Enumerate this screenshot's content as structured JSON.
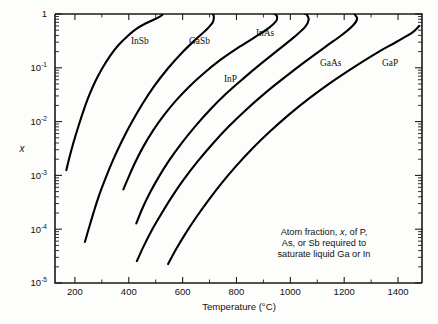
{
  "chart_data": {
    "type": "line",
    "title": "",
    "xlabel": "Temperature (°C)",
    "ylabel": "x",
    "yscale": "log",
    "xlim": [
      126,
      1489
    ],
    "ylim": [
      1e-05,
      1
    ],
    "grid": false,
    "legend": "inline-curve-labels",
    "x_ticks_major": [
      200,
      400,
      600,
      800,
      1000,
      1200,
      1400
    ],
    "x_tick_labels": [
      "200",
      "400",
      "600",
      "800",
      "1000",
      "1200",
      "1400"
    ],
    "x_ticks_minor": [
      300,
      500,
      700,
      900,
      1100,
      1300
    ],
    "y_ticks_major": [
      1,
      0.1,
      0.01,
      0.001,
      0.0001,
      1e-05
    ],
    "y_tick_labels": [
      "1",
      "10⁻¹",
      "10⁻²",
      "10⁻³",
      "10⁻⁴",
      "10⁻⁵"
    ],
    "annotation": {
      "lines": [
        "Atom fraction, x, of P,",
        "As, or Sb required to",
        "saturate liquid Ga or In"
      ],
      "italic_token": "x"
    },
    "series": [
      {
        "name": "InSb",
        "label": "InSb",
        "label_x": 131,
        "label_y": 44,
        "points": [
          [
            168,
            0.00125
          ],
          [
            180,
            0.0022
          ],
          [
            196,
            0.0043
          ],
          [
            213,
            0.0082
          ],
          [
            232,
            0.016
          ],
          [
            252,
            0.03
          ],
          [
            275,
            0.055
          ],
          [
            300,
            0.095
          ],
          [
            330,
            0.165
          ],
          [
            362,
            0.265
          ],
          [
            398,
            0.4
          ],
          [
            432,
            0.545
          ],
          [
            462,
            0.665
          ],
          [
            490,
            0.775
          ],
          [
            512,
            0.875
          ],
          [
            524,
            0.96
          ],
          [
            524,
            1.0
          ]
        ]
      },
      {
        "name": "GaSb",
        "label": "GaSb",
        "label_x": 189,
        "label_y": 44,
        "points": [
          [
            237,
            5.8e-05
          ],
          [
            252,
            0.000105
          ],
          [
            270,
            0.00021
          ],
          [
            290,
            0.00043
          ],
          [
            315,
            0.00092
          ],
          [
            343,
            0.002
          ],
          [
            375,
            0.0044
          ],
          [
            410,
            0.0095
          ],
          [
            450,
            0.021
          ],
          [
            495,
            0.046
          ],
          [
            545,
            0.097
          ],
          [
            595,
            0.185
          ],
          [
            645,
            0.325
          ],
          [
            690,
            0.52
          ],
          [
            712,
            0.7
          ],
          [
            716,
            0.88
          ],
          [
            712,
            1.0
          ]
        ]
      },
      {
        "name": "InAs",
        "label": "InAs",
        "label_x": 256,
        "label_y": 36,
        "points": [
          [
            380,
            0.00055
          ],
          [
            400,
            0.00095
          ],
          [
            425,
            0.0018
          ],
          [
            455,
            0.0035
          ],
          [
            490,
            0.0068
          ],
          [
            530,
            0.013
          ],
          [
            575,
            0.0245
          ],
          [
            625,
            0.045
          ],
          [
            680,
            0.08
          ],
          [
            740,
            0.14
          ],
          [
            805,
            0.235
          ],
          [
            870,
            0.375
          ],
          [
            922,
            0.56
          ],
          [
            948,
            0.75
          ],
          [
            950,
            0.92
          ],
          [
            942,
            1.0
          ]
        ]
      },
      {
        "name": "InP",
        "label": "InP",
        "label_x": 224,
        "label_y": 82,
        "points": [
          [
            428,
            0.000128
          ],
          [
            450,
            0.00024
          ],
          [
            478,
            0.00047
          ],
          [
            512,
            0.00095
          ],
          [
            550,
            0.0019
          ],
          [
            595,
            0.0039
          ],
          [
            645,
            0.008
          ],
          [
            700,
            0.0163
          ],
          [
            760,
            0.0325
          ],
          [
            825,
            0.063
          ],
          [
            890,
            0.118
          ],
          [
            955,
            0.215
          ],
          [
            1015,
            0.375
          ],
          [
            1055,
            0.575
          ],
          [
            1068,
            0.78
          ],
          [
            1062,
            0.96
          ],
          [
            1055,
            1.0
          ]
        ]
      },
      {
        "name": "GaAs",
        "label": "GaAs",
        "label_x": 320,
        "label_y": 66,
        "points": [
          [
            430,
            2.55e-05
          ],
          [
            455,
            4.8e-05
          ],
          [
            485,
            9.5e-05
          ],
          [
            520,
            0.00019
          ],
          [
            560,
            0.0004
          ],
          [
            605,
            0.00085
          ],
          [
            655,
            0.0018
          ],
          [
            710,
            0.0038
          ],
          [
            770,
            0.008
          ],
          [
            835,
            0.0165
          ],
          [
            905,
            0.0335
          ],
          [
            980,
            0.067
          ],
          [
            1055,
            0.13
          ],
          [
            1130,
            0.245
          ],
          [
            1195,
            0.42
          ],
          [
            1235,
            0.63
          ],
          [
            1248,
            0.82
          ],
          [
            1238,
            1.0
          ]
        ]
      },
      {
        "name": "GaP",
        "label": "GaP",
        "label_x": 382,
        "label_y": 66,
        "points": [
          [
            546,
            2.25e-05
          ],
          [
            575,
            4.2e-05
          ],
          [
            610,
            8.2e-05
          ],
          [
            650,
            0.000165
          ],
          [
            695,
            0.00034
          ],
          [
            745,
            0.00072
          ],
          [
            800,
            0.00152
          ],
          [
            860,
            0.0032
          ],
          [
            925,
            0.0066
          ],
          [
            995,
            0.0135
          ],
          [
            1070,
            0.027
          ],
          [
            1150,
            0.053
          ],
          [
            1235,
            0.102
          ],
          [
            1320,
            0.188
          ],
          [
            1400,
            0.315
          ],
          [
            1455,
            0.46
          ],
          [
            1478,
            0.6
          ]
        ]
      }
    ]
  },
  "figure": {
    "x_axis_title": "Temperature (°C)",
    "y_axis_title": "x"
  }
}
